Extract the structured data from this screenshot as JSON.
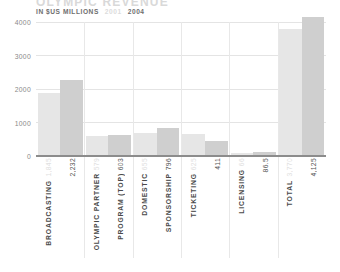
{
  "header": {
    "title": "OLYMPIC REVENUE",
    "units_label": "IN $US MILLIONS",
    "legend": [
      {
        "key": "y2001",
        "label": "2001",
        "color": "#e6e6e6"
      },
      {
        "key": "y2004",
        "label": "2004",
        "color": "#cfcfcf"
      }
    ]
  },
  "chart_data": {
    "type": "bar",
    "title": "OLYMPIC REVENUE",
    "subtitle": "IN $US MILLIONS",
    "xlabel": "",
    "ylabel": "",
    "ylim": [
      0,
      4000
    ],
    "yticks": [
      "0",
      "1000",
      "2000",
      "3000",
      "4000"
    ],
    "grid": true,
    "legend_position": "top-left",
    "categories": [
      "BROADCASTING",
      "OLYMPIC PARTNER PROGRAM (TOP)",
      "DOMESTIC SPONSORSHIP",
      "TICKETING",
      "LICENSING",
      "TOTAL"
    ],
    "category_lines": [
      [
        "BROADCASTING",
        ""
      ],
      [
        "OLYMPIC PARTNER",
        "PROGRAM (TOP)"
      ],
      [
        "DOMESTIC",
        "SPONSORSHIP"
      ],
      [
        "TICKETING",
        ""
      ],
      [
        "LICENSING",
        ""
      ],
      [
        "TOTAL",
        ""
      ]
    ],
    "series": [
      {
        "name": "2001",
        "color": "#e6e6e6",
        "values": [
          1845,
          579,
          655,
          625,
          66,
          3770
        ],
        "labels": [
          "1,845",
          "579",
          "655",
          "625",
          "66",
          "3,770"
        ]
      },
      {
        "name": "2004",
        "color": "#cfcfcf",
        "values": [
          2232,
          603,
          796,
          411,
          86.5,
          4125
        ],
        "labels": [
          "2,232",
          "603",
          "796",
          "411",
          "86.5",
          "4,125"
        ]
      }
    ]
  }
}
